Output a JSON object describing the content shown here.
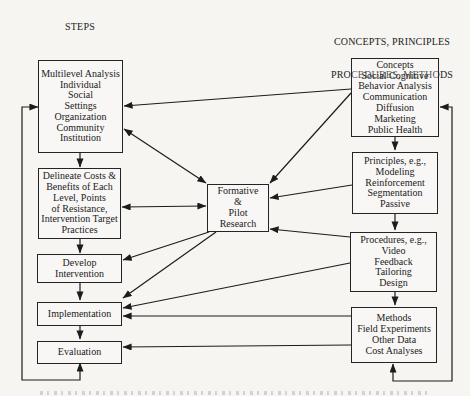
{
  "page": {
    "background": "#f6f5f2",
    "line_color": "#1c1c1c",
    "text_color": "#1b1b1b"
  },
  "headers": {
    "left": "STEPS",
    "right_line1": "CONCEPTS, PRINCIPLES",
    "right_line2": "PROCEDURES, METHODS"
  },
  "boxes": {
    "multilevel": {
      "lines": [
        "Multilevel Analysis",
        "Individual",
        "Social",
        "Settings",
        "Organization",
        "Community",
        "Institution"
      ]
    },
    "delineate": {
      "lines": [
        "Delineate Costs &",
        "Benefits of Each",
        "Level, Points",
        "of Resistance,",
        "Intervention Target",
        "Practices"
      ]
    },
    "develop": {
      "lines": [
        "Develop",
        "Intervention"
      ]
    },
    "implementation": {
      "lines": [
        "Implementation"
      ]
    },
    "evaluation": {
      "lines": [
        "Evaluation"
      ]
    },
    "formative": {
      "lines": [
        "Formative",
        "&",
        "Pilot",
        "Research"
      ]
    },
    "concepts": {
      "lines": [
        "Concepts",
        "Social Cognitive",
        "Behavior Analysis",
        "Communication",
        "Diffusion",
        "Marketing",
        "Public Health"
      ]
    },
    "principles": {
      "lines": [
        "Principles, e.g.,",
        "Modeling",
        "Reinforcement",
        "Segmentation",
        "Passive"
      ]
    },
    "procedures": {
      "lines": [
        "Procedures, e.g.,",
        "Video",
        "Feedback",
        "Tailoring",
        "Design"
      ]
    },
    "methods": {
      "lines": [
        "Methods",
        "Field Experiments",
        "Other Data",
        "Cost Analyses"
      ]
    }
  },
  "connections": [
    {
      "from": "evaluation",
      "to": "multilevel",
      "type": "two-way-feedback-loop"
    },
    {
      "from": "multilevel",
      "to": "delineate",
      "type": "one-way"
    },
    {
      "from": "delineate",
      "to": "develop",
      "type": "one-way"
    },
    {
      "from": "develop",
      "to": "implementation",
      "type": "one-way"
    },
    {
      "from": "implementation",
      "to": "evaluation",
      "type": "one-way"
    },
    {
      "from": "concepts",
      "to": "multilevel",
      "type": "one-way"
    },
    {
      "from": "multilevel",
      "to": "formative",
      "type": "two-way"
    },
    {
      "from": "concepts",
      "to": "formative",
      "type": "one-way"
    },
    {
      "from": "delineate",
      "to": "formative",
      "type": "two-way"
    },
    {
      "from": "principles",
      "to": "formative",
      "type": "one-way"
    },
    {
      "from": "procedures",
      "to": "formative",
      "type": "one-way"
    },
    {
      "from": "formative",
      "to": "develop",
      "type": "one-way"
    },
    {
      "from": "formative",
      "to": "implementation",
      "type": "one-way"
    },
    {
      "from": "procedures",
      "to": "implementation",
      "type": "one-way"
    },
    {
      "from": "methods",
      "to": "implementation",
      "type": "one-way"
    },
    {
      "from": "methods",
      "to": "evaluation",
      "type": "one-way"
    },
    {
      "from": "concepts",
      "to": "principles",
      "type": "one-way"
    },
    {
      "from": "principles",
      "to": "procedures",
      "type": "one-way"
    },
    {
      "from": "procedures",
      "to": "methods",
      "type": "one-way"
    },
    {
      "from": "methods",
      "to": "concepts",
      "type": "two-way-feedback-loop"
    }
  ]
}
